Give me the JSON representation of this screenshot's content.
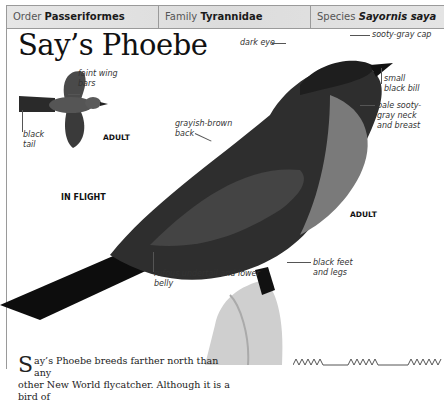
{
  "header": {
    "order_label": "Order",
    "order_value": "Passeriformes",
    "family_label": "Family",
    "family_value": "Tyrannidae",
    "species_label": "Species",
    "species_value": "Sayornis saya"
  },
  "title": "Say’s Phoebe",
  "flight_figure": {
    "annotations": {
      "wing_bars": "faint wing bars",
      "tail": "black tail"
    },
    "age_label": "ADULT",
    "caption": "IN FLIGHT"
  },
  "main_figure": {
    "annotations": {
      "cap": "sooty-gray cap",
      "eye": "dark eye",
      "bill": "small black bill",
      "neck": "pale sooty-gray neck and breast",
      "back": "grayish-brown back",
      "undertail": "rufous undertail and lower belly",
      "feet": "black feet and legs"
    },
    "age_label": "ADULT"
  },
  "body_text": {
    "dropcap": "S",
    "line1": "ay’s Phoebe breeds farther north than any",
    "line2": "other New World flycatcher. Although it is a bird of"
  },
  "song_graphic": {
    "icon": "sonogram-icon"
  }
}
